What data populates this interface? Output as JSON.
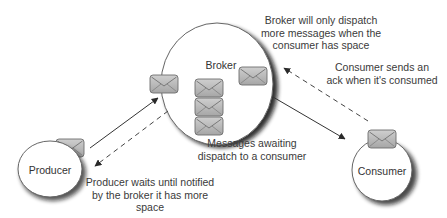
{
  "diagram": {
    "nodes": {
      "broker": {
        "label": "Broker"
      },
      "producer": {
        "label": "Producer"
      },
      "consumer": {
        "label": "Consumer"
      }
    },
    "annotations": {
      "broker_dispatch": {
        "line1": "Broker will only dispatch",
        "line2": "more messages when the",
        "line3": "consumer has space"
      },
      "consumer_ack": {
        "line1": "Consumer sends an",
        "line2": "ack when it's consumed"
      },
      "messages_waiting": {
        "line1": "Messages awaiting",
        "line2": "dispatch to a consumer"
      },
      "producer_wait": {
        "line1": "Producer waits until notified",
        "line2": "by the broker it has more",
        "line3": "space"
      }
    },
    "edges": [
      {
        "from": "producer",
        "to": "broker",
        "style": "solid",
        "meaning": "send message"
      },
      {
        "from": "broker",
        "to": "producer",
        "style": "dashed",
        "meaning": "notify space available"
      },
      {
        "from": "broker",
        "to": "consumer",
        "style": "solid",
        "meaning": "dispatch message"
      },
      {
        "from": "consumer",
        "to": "broker",
        "style": "dashed",
        "meaning": "ack"
      }
    ],
    "icons": {
      "message": "envelope-icon"
    },
    "colors": {
      "envelope_fill": "#b8b8b8",
      "envelope_stroke": "#6e6e6e",
      "node_fill": "#ffffff",
      "node_stroke": "#555555",
      "shadow": "#222222",
      "arrow": "#333333"
    }
  }
}
